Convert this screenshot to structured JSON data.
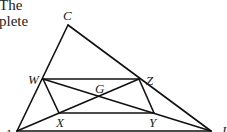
{
  "text_fragments": {
    "line1": "The",
    "line2": "plete"
  },
  "diagram": {
    "stroke_color": "#111111",
    "points": {
      "C": {
        "x": 68,
        "y": 25,
        "label": "C"
      },
      "W": {
        "x": 43,
        "y": 79,
        "label": "W"
      },
      "Z": {
        "x": 139,
        "y": 79,
        "label": "Z"
      },
      "G": {
        "x": 100,
        "y": 97,
        "label": "G"
      },
      "X": {
        "x": 59,
        "y": 113,
        "label": "X"
      },
      "Y": {
        "x": 154,
        "y": 113,
        "label": "Y"
      },
      "A": {
        "x": 17,
        "y": 131,
        "label": "A"
      },
      "B": {
        "x": 211,
        "y": 131,
        "label": "I"
      }
    },
    "segments": [
      [
        "A",
        "C"
      ],
      [
        "C",
        "B"
      ],
      [
        "A",
        "B"
      ],
      [
        "W",
        "Z"
      ],
      [
        "X",
        "Y"
      ],
      [
        "W",
        "X"
      ],
      [
        "Z",
        "Y"
      ],
      [
        "W",
        "B"
      ],
      [
        "A",
        "Z"
      ]
    ]
  }
}
